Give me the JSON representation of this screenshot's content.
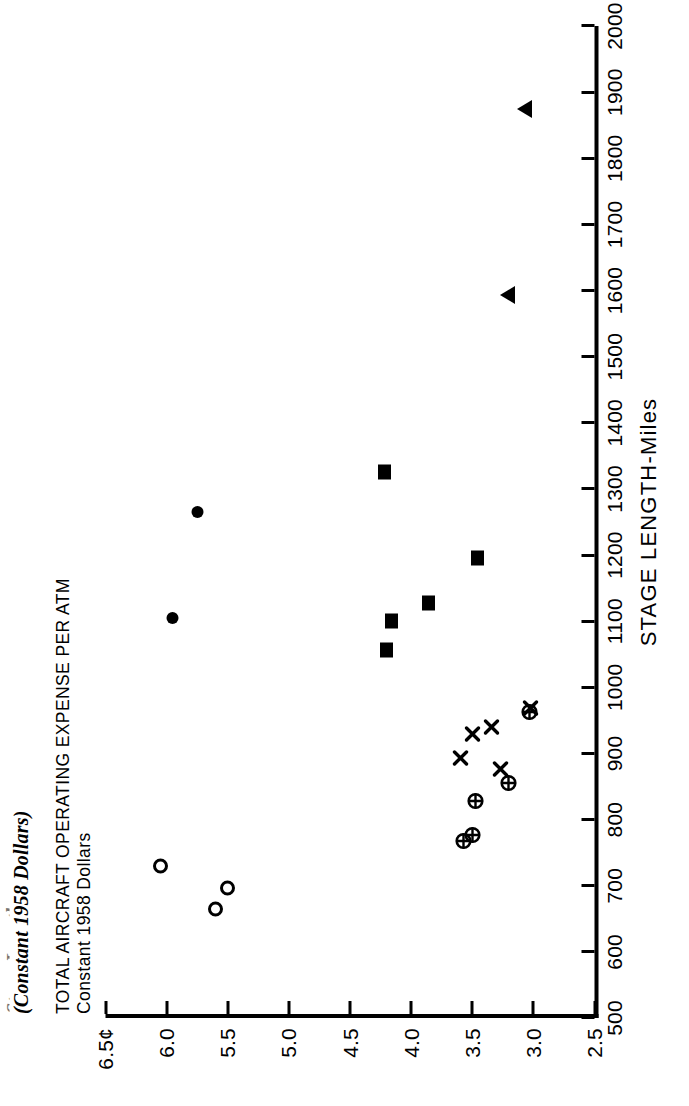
{
  "figure": {
    "title_line_1_clipped": "Stage Length",
    "title_line_2": "(Constant 1958 Dollars)",
    "y_axis_title_line_1": "TOTAL AIRCRAFT OPERATING EXPENSE PER ATM",
    "y_axis_title_line_2": "Constant 1958 Dollars",
    "x_axis_title": "STAGE LENGTH-Miles"
  },
  "chart_data": {
    "type": "scatter",
    "title": "(Constant 1958 Dollars)",
    "xlabel": "STAGE LENGTH-Miles",
    "ylabel": "TOTAL AIRCRAFT OPERATING EXPENSE PER ATM  Constant 1958 Dollars",
    "xlim": [
      500,
      2000
    ],
    "ylim": [
      2.5,
      6.5
    ],
    "xticks": [
      500,
      600,
      700,
      800,
      900,
      1000,
      1100,
      1200,
      1300,
      1400,
      1500,
      1600,
      1700,
      1800,
      1900,
      2000
    ],
    "xticklabels": [
      "500",
      "600",
      "700",
      "800",
      "900",
      "1000",
      "1100",
      "1200",
      "1300",
      "1400",
      "1500",
      "1600",
      "1700",
      "1800",
      "1900",
      "2000"
    ],
    "yticks": [
      2.5,
      3.0,
      3.5,
      4.0,
      4.5,
      5.0,
      5.5,
      6.0,
      6.5
    ],
    "yticklabels": [
      "2.5",
      "3.0",
      "3.5",
      "4.0",
      "4.5",
      "5.0",
      "5.5",
      "6.0",
      "6.5¢"
    ],
    "grid": false,
    "legend": "none",
    "y_unit": "cents",
    "series": [
      {
        "name": "open-circle",
        "marker": "open-circle",
        "points": [
          {
            "x": 730,
            "y": 6.05
          },
          {
            "x": 665,
            "y": 5.6
          },
          {
            "x": 697,
            "y": 5.5
          }
        ]
      },
      {
        "name": "filled-circle",
        "marker": "filled-circle",
        "points": [
          {
            "x": 1105,
            "y": 5.95
          },
          {
            "x": 1265,
            "y": 5.75
          }
        ]
      },
      {
        "name": "filled-square",
        "marker": "filled-square",
        "points": [
          {
            "x": 1325,
            "y": 4.22
          },
          {
            "x": 1100,
            "y": 4.16
          },
          {
            "x": 1057,
            "y": 4.2
          },
          {
            "x": 1127,
            "y": 3.86
          },
          {
            "x": 1196,
            "y": 3.46
          }
        ]
      },
      {
        "name": "cross",
        "marker": "cross",
        "points": [
          {
            "x": 968,
            "y": 3.02
          },
          {
            "x": 940,
            "y": 3.34
          },
          {
            "x": 930,
            "y": 3.5
          },
          {
            "x": 893,
            "y": 3.6
          },
          {
            "x": 876,
            "y": 3.27
          }
        ]
      },
      {
        "name": "circle-cross",
        "marker": "circle-cross",
        "points": [
          {
            "x": 963,
            "y": 3.03
          },
          {
            "x": 856,
            "y": 3.2
          },
          {
            "x": 828,
            "y": 3.47
          },
          {
            "x": 777,
            "y": 3.5
          },
          {
            "x": 768,
            "y": 3.57
          }
        ]
      },
      {
        "name": "triangle",
        "marker": "triangle",
        "points": [
          {
            "x": 1875,
            "y": 3.07
          },
          {
            "x": 1594,
            "y": 3.21
          }
        ]
      }
    ]
  }
}
